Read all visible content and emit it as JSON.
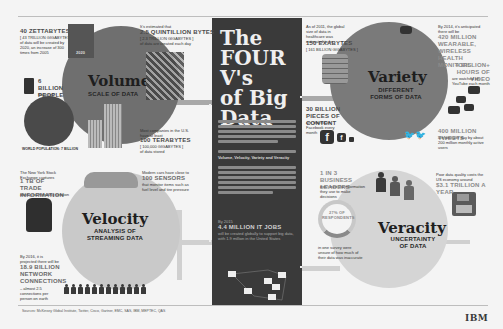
{
  "title": {
    "line1": "The",
    "line2": "FOUR V's",
    "line3": "of Big",
    "line4": "Data"
  },
  "center": {
    "jobs_prefix": "By 2015",
    "jobs_value": "4.4 MILLION IT JOBS",
    "jobs_desc": "will be created globally to support big data, with 1.9 million in the United States",
    "v_list": "Volume, Velocity, Variety and Veracity"
  },
  "volume": {
    "title": "Volume",
    "subtitle": "SCALE OF DATA",
    "stat1_value": "40 ZETTABYTES",
    "stat1_sub": "[ 43 TRILLION GIGABYTES ]",
    "stat1_desc": "of data will be created by 2020, an increase of 300 times from 2005",
    "stat2_prefix": "It's estimated that",
    "stat2_value": "2.5 QUINTILLION BYTES",
    "stat2_sub": "[ 2.3 TRILLION GIGABYTES ]",
    "stat2_desc": "of data are created each day",
    "stat3_value": "6 BILLION PEOPLE",
    "stat3_desc": "have cell phones",
    "stat4_prefix": "Most companies in the U.S. have at least",
    "stat4_value": "100 TERABYTES",
    "stat4_sub": "[ 100,000 GIGABYTES ]",
    "stat4_desc": "of data stored",
    "world_pop": "WORLD POPULATION: 7 BILLION",
    "year_label": "2020"
  },
  "variety": {
    "title": "Variety",
    "subtitle_l1": "DIFFERENT",
    "subtitle_l2": "FORMS OF DATA",
    "stat1_prefix": "As of 2011, the global size of data in healthcare was estimated to be",
    "stat1_value": "150 EXABYTES",
    "stat1_sub": "[ 161 BILLION GIGABYTES ]",
    "stat2_value": "30 BILLION PIECES OF CONTENT",
    "stat2_desc": "are shared on Facebook every month",
    "stat3_prefix": "By 2014, it's anticipated there will be",
    "stat3_value": "420 MILLION WEARABLE, WIRELESS HEALTH MONITORS",
    "stat4_value": "4 BILLION+ HOURS OF VIDEO",
    "stat4_desc": "are watched on YouTube each month",
    "stat5_value": "400 MILLION TWEETS",
    "stat5_desc": "are sent per day by about 200 million monthly active users"
  },
  "velocity": {
    "title": "Velocity",
    "subtitle_l1": "ANALYSIS OF",
    "subtitle_l2": "STREAMING DATA",
    "stat1_prefix": "The New York Stock Exchange captures",
    "stat1_value": "1 TB OF TRADE INFORMATION",
    "stat1_desc": "during each trading session",
    "stat2_prefix": "Modern cars have close to",
    "stat2_value": "100 SENSORS",
    "stat2_desc": "that monitor items such as fuel level and tire pressure",
    "stat3_prefix": "By 2016, it is projected there will be",
    "stat3_value": "18.9 BILLION NETWORK CONNECTIONS",
    "stat3_desc": "– almost 2.5 connections per person on earth"
  },
  "veracity": {
    "title": "Veracity",
    "subtitle_l1": "UNCERTAINTY",
    "subtitle_l2": "OF DATA",
    "stat1_value": "1 IN 3 BUSINESS LEADERS",
    "stat1_desc": "don't trust the information they use to make decisions",
    "stat2_value": "27% OF RESPONDENTS",
    "stat2_desc": "in one survey were unsure of how much of their data was inaccurate",
    "stat3_prefix": "Poor data quality costs the US economy around",
    "stat3_value": "$3.1 TRILLION A YEAR"
  },
  "footer": {
    "source": "Sources: McKinsey Global Institute, Twitter, Cisco, Gartner, EMC, SAS, IBM, MEPTEC, QAS",
    "brand": "IBM"
  },
  "colors": {
    "center_panel": "#3a3a3a",
    "volume_circle": "#6f6f6f",
    "variety_circle": "#7a7a7a",
    "velocity_circle": "#c9c9c9",
    "veracity_circle": "#d5d5d5"
  }
}
